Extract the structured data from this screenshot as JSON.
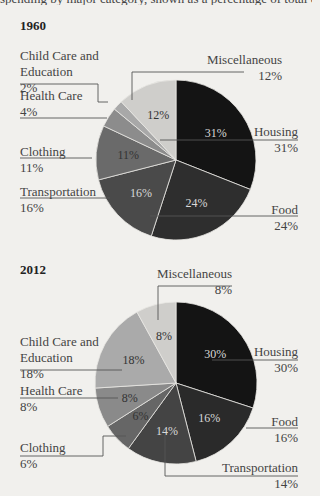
{
  "header": {
    "cut_text": "spending by major category, shown as a percentage of total expenditures"
  },
  "chart_data": [
    {
      "type": "pie",
      "title": "1960",
      "categories": [
        "Housing",
        "Food",
        "Transportation",
        "Clothing",
        "Health Care",
        "Child Care and Education",
        "Miscellaneous"
      ],
      "values": [
        31,
        24,
        16,
        11,
        4,
        2,
        12
      ],
      "colors": [
        "#141414",
        "#2e2e2e",
        "#4a4a4a",
        "#6a6a6a",
        "#8c8c8c",
        "#a8a8a8",
        "#cfcecb"
      ],
      "labels_pct": [
        "31%",
        "24%",
        "16%",
        "11%",
        "4%",
        "2%",
        "12%"
      ]
    },
    {
      "type": "pie",
      "title": "2012",
      "categories": [
        "Housing",
        "Food",
        "Transportation",
        "Clothing",
        "Health Care",
        "Child Care and Education",
        "Miscellaneous"
      ],
      "values": [
        30,
        16,
        14,
        6,
        8,
        18,
        8
      ],
      "colors": [
        "#141414",
        "#2a2a2a",
        "#444444",
        "#666666",
        "#8a8a8a",
        "#aaaaaa",
        "#cfcecb"
      ],
      "labels_pct": [
        "30%",
        "16%",
        "14%",
        "6%",
        "8%",
        "18%",
        "8%"
      ]
    }
  ],
  "c1960": {
    "title": "1960",
    "misc": {
      "name": "Miscellaneous",
      "pct": "12%"
    },
    "child": {
      "name1": "Child Care and",
      "name2": "Education",
      "pct": "2%"
    },
    "health": {
      "name": "Health Care",
      "pct": "4%"
    },
    "clothing": {
      "name": "Clothing",
      "pct": "11%"
    },
    "transport": {
      "name": "Transportation",
      "pct": "16%"
    },
    "housing": {
      "name": "Housing",
      "pct": "31%"
    },
    "food": {
      "name": "Food",
      "pct": "24%"
    }
  },
  "c2012": {
    "title": "2012",
    "misc": {
      "name": "Miscellaneous",
      "pct": "8%"
    },
    "child": {
      "name1": "Child Care and",
      "name2": "Education",
      "pct": "18%"
    },
    "health": {
      "name": "Health Care",
      "pct": "8%"
    },
    "clothing": {
      "name": "Clothing",
      "pct": "6%"
    },
    "transport": {
      "name": "Transportation",
      "pct": "14%"
    },
    "housing": {
      "name": "Housing",
      "pct": "30%"
    },
    "food": {
      "name": "Food",
      "pct": "16%"
    }
  }
}
